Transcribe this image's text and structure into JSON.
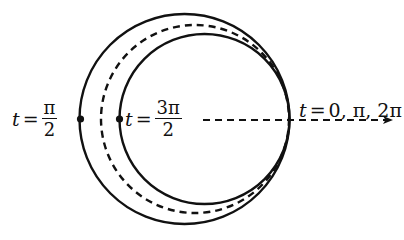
{
  "diagram": {
    "colors": {
      "stroke": "#111111",
      "background": "#ffffff"
    },
    "circles": [
      {
        "name": "outer",
        "style": "solid",
        "cx": 184.5,
        "cy": 119,
        "r": 105
      },
      {
        "name": "middle",
        "style": "dashed",
        "cx": 195,
        "cy": 119,
        "r": 94
      },
      {
        "name": "inner",
        "style": "solid",
        "cx": 204.5,
        "cy": 119,
        "r": 85
      }
    ],
    "points": [
      {
        "name": "point-t-pi-over-2",
        "x": 80,
        "y": 119
      },
      {
        "name": "point-t-3pi-over-2",
        "x": 119,
        "y": 119
      }
    ],
    "axis": {
      "style": "dashed",
      "x1": 203,
      "y1": 120,
      "x2": 392,
      "y2": 120,
      "arrow": true
    },
    "labels": {
      "left": {
        "variable": "t",
        "equals": "=",
        "numerator": "π",
        "denominator": "2"
      },
      "middle": {
        "variable": "t",
        "equals": "=",
        "numerator": "3π",
        "denominator": "2"
      },
      "right": {
        "variable": "t",
        "equals": "=",
        "values": "0, π, 2π"
      }
    }
  }
}
